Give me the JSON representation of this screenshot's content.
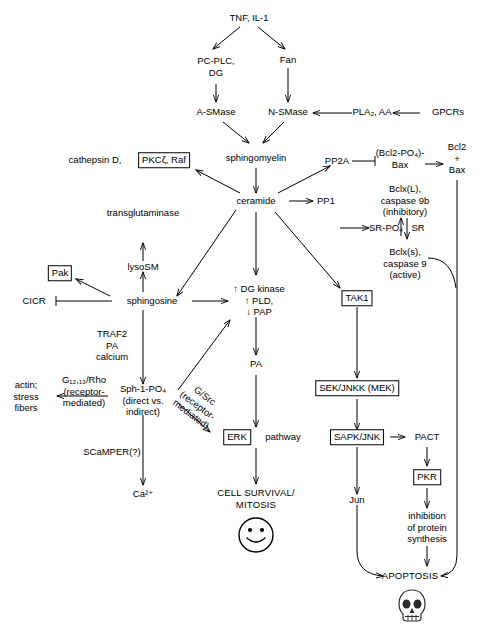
{
  "diagram": {
    "nodes": {
      "tnf_il1": "TNF, IL-1",
      "pc_plc_dg": "PC-PLC,\nDG",
      "fan": "Fan",
      "a_smase": "A-SMase",
      "n_smase": "N-SMase",
      "pla2_aa": "PLA₂, AA",
      "gpcrs": "GPCRs",
      "cathepsin_d": "cathepsin D,",
      "pkcz_raf": "PKCζ, Raf",
      "sphingomyelin": "sphingomyelin",
      "pp2a": "PP2A",
      "bcl2_po4_bax": "(Bcl2-PO₄)-\nBax",
      "bcl2_plus_bax": "Bcl2\n+\nBax",
      "transglutaminase": "transglutaminase",
      "ceramide": "ceramide",
      "pp1": "PP1",
      "sr_po4": "SR-PO₄",
      "sr": "SR",
      "bclxl_caspase9b": "Bclx(L),\ncaspase 9b\n(inhibitory)",
      "bclxs_caspase9": "Bclx(s),\ncaspase 9\n(active)",
      "pak": "Pak",
      "lysosm": "lysoSM",
      "cicr": "CICR",
      "sphingosine": "sphingosine",
      "dg_kinase_pld_pap": "↑ DG kinase\n↑ PLD,\n↓ PAP",
      "tak1": "TAK1",
      "traf2_pa_calcium": "TRAF2\nPA\ncalcium",
      "pa": "PA",
      "sek_jnkk_mek": "SEK/JNKK (MEK)",
      "actin_stress_fibers": "actin;\nstress\nfibers",
      "g1213_rho": "G₁₂,₁₃/Rho\n(receptor-\nmediated)",
      "sph_1_po4": "Sph-1-PO₄\n(direct vs.\nindirect)",
      "g_src": "G/Src\n(receptor-\nmediated)",
      "erk": "ERK",
      "pathway": "pathway",
      "sapk_jnk": "SAPK/JNK",
      "pact": "PACT",
      "scamper": "SCaMPER(?)",
      "pkr": "PKR",
      "ca2": "Ca²⁺",
      "cell_survival_mitosis": "CELL SURVIVAL/\nMITOSIS",
      "jun": "Jun",
      "inhibition_protein_synthesis": "inhibition\nof protein\nsynthesis",
      "apoptosis": "APOPTOSIS"
    },
    "icons": {
      "smiley": "smiley-face-icon",
      "skull": "skull-icon"
    },
    "colors": {
      "stroke": "#000000",
      "background": "#ffffff",
      "text": "#000000"
    }
  }
}
